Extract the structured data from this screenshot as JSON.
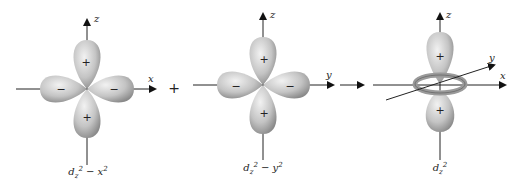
{
  "diagrams": [
    {
      "id": "dz2-x2",
      "caption_main": "d",
      "caption_sub": "z",
      "caption_sup1": "2",
      "caption_minus": " − x",
      "caption_sup2": "2",
      "vertical_axis": "z",
      "horizontal_axis": "x",
      "lobe_signs": {
        "top": "+",
        "bottom": "+",
        "left": "−",
        "right": "−"
      }
    },
    {
      "id": "dz2-y2",
      "caption_main": "d",
      "caption_sub": "z",
      "caption_sup1": "2",
      "caption_minus": " − y",
      "caption_sup2": "2",
      "vertical_axis": "z",
      "horizontal_axis": "y",
      "lobe_signs": {
        "top": "+",
        "bottom": "+",
        "left": "−",
        "right": "−"
      }
    },
    {
      "id": "dz2",
      "caption_main": "d",
      "caption_sub": "z",
      "caption_sup1": "2",
      "vertical_axis": "z",
      "horizontal_axis": "x",
      "diagonal_axis": "y",
      "lobe_signs": {
        "top": "+",
        "bottom": "+"
      }
    }
  ],
  "operators": {
    "plus": "+"
  },
  "colors": {
    "lobe": "#c8c8c8",
    "lobe_dark": "#8f8f8f",
    "axis": "#222222"
  }
}
